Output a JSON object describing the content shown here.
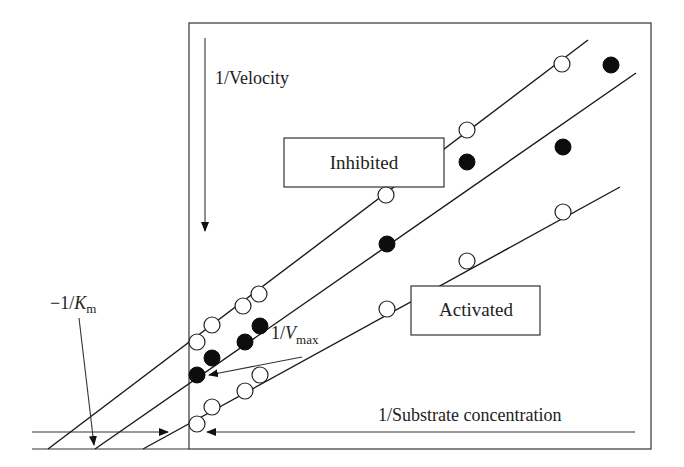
{
  "chart_data": {
    "type": "scatter",
    "xlabel": "1/Substrate concentration",
    "ylabel": "1/Velocity",
    "annotations": {
      "km_intercept": "-1/K",
      "km_subscript": "m",
      "vmax_intercept": "1/V",
      "vmax_subscript": "max"
    },
    "legend_boxes": [
      "Inhibited",
      "Activated"
    ],
    "series": [
      {
        "name": "Inhibited",
        "marker": "open-circle",
        "line": {
          "x1": 48,
          "y1": 449,
          "x2": 588,
          "y2": 40
        },
        "points": [
          [
            197,
            342
          ],
          [
            212,
            325
          ],
          [
            243,
            306
          ],
          [
            259,
            294
          ],
          [
            386,
            195
          ],
          [
            467,
            130
          ],
          [
            562,
            64
          ]
        ]
      },
      {
        "name": "Control",
        "marker": "filled-circle",
        "line": {
          "x1": 95,
          "y1": 449,
          "x2": 636,
          "y2": 73
        },
        "points": [
          [
            197,
            375
          ],
          [
            212,
            358
          ],
          [
            245,
            342
          ],
          [
            260,
            326
          ],
          [
            387,
            244
          ],
          [
            467,
            162
          ],
          [
            563,
            147
          ],
          [
            611,
            65
          ]
        ]
      },
      {
        "name": "Activated",
        "marker": "open-circle",
        "line": {
          "x1": 143,
          "y1": 449,
          "x2": 620,
          "y2": 187
        },
        "points": [
          [
            197,
            424
          ],
          [
            212,
            407
          ],
          [
            245,
            391
          ],
          [
            260,
            375
          ],
          [
            387,
            309
          ],
          [
            467,
            261
          ],
          [
            563,
            212
          ]
        ]
      }
    ],
    "axes": {
      "frame": {
        "x": 189,
        "y": 23,
        "width": 462,
        "height": 426
      },
      "x_axis_y": 432,
      "y_axis_x": 189
    }
  }
}
